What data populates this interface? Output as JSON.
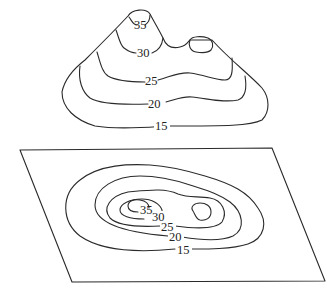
{
  "figure": {
    "top_view": {
      "name": "mountain-3d-view",
      "contour_labels": [
        "35",
        "30",
        "25",
        "20",
        "15"
      ]
    },
    "bottom_view": {
      "name": "contour-map-plane",
      "contour_labels": [
        "35",
        "30",
        "25",
        "20",
        "15"
      ]
    },
    "caption": ""
  },
  "colors": {
    "line": "#2a2a2a",
    "background": "#ffffff"
  }
}
